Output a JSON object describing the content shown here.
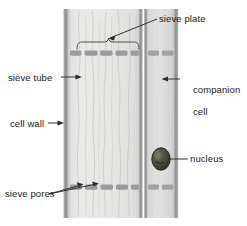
{
  "figure": {
    "type": "labelled biological diagram",
    "width": 247,
    "height": 226,
    "background": "#ffffff"
  },
  "labels": {
    "sieve_plate": "sieve plate",
    "sieve_tube": "sieve tube",
    "cell_wall": "cell wall",
    "sieve_pores": "sieve pores",
    "companion_cell_line1": "companion",
    "companion_cell_line2": "cell",
    "nucleus": "nucleus"
  },
  "colors": {
    "label_text": "#1b1b1b",
    "leader_line": "#2a2a2a",
    "cell_wall": "#9a9a9a",
    "cell_wall_dark": "#8a8a8a",
    "sieve_tube_fill": "#e6e6e4",
    "companion_cell_fill": "#dedede",
    "sieve_plate_bar": "#9b9b9b",
    "nucleus_fill": "#4a4a40",
    "nucleus_outline": "#2e2e28",
    "cytoplasm_strand": "#c9c9c7",
    "page_background": "#ffffff"
  },
  "structures": {
    "sieve_tube": {
      "description": "large central cell with faint vertical cytoplasmic strands",
      "x": 70,
      "y": 9,
      "width": 70,
      "height": 209
    },
    "companion_cell": {
      "description": "narrow cell on the right of the sieve tube, contains the nucleus",
      "x": 147,
      "y": 9,
      "width": 30,
      "height": 209
    },
    "nucleus": {
      "description": "dark oval organelle inside companion cell",
      "cx": 161,
      "cy": 159,
      "rx": 9,
      "ry": 11
    },
    "sieve_plates": [
      {
        "name": "upper-sieve-plate",
        "y": 51,
        "segments": 5,
        "companion_segments": 2
      },
      {
        "name": "lower-sieve-plate",
        "y": 185,
        "segments": 5,
        "companion_segments": 2
      }
    ],
    "cell_walls": [
      {
        "name": "left-cell-wall",
        "x": 64
      },
      {
        "name": "inner-right-cell-wall",
        "x": 140
      },
      {
        "name": "companion-left-cell-wall",
        "x": 146
      },
      {
        "name": "right-cell-wall",
        "x": 176
      }
    ],
    "bracket": {
      "name": "sieve-plate-bracket",
      "description": "curly bracket spanning the upper sieve plate",
      "x1": 77,
      "x2": 139,
      "y": 41
    }
  },
  "leader_lines": [
    {
      "name": "sieve-plate-leader",
      "from": "sieve plate label",
      "to": "upper sieve plate bracket",
      "arrow": true
    },
    {
      "name": "sieve-tube-leader",
      "from": "sieve tube label",
      "to": "sieve tube interior",
      "arrow": true
    },
    {
      "name": "cell-wall-leader",
      "from": "cell wall label",
      "to": "left cell wall",
      "arrow": true
    },
    {
      "name": "sieve-pores-leader-1",
      "from": "sieve pores label",
      "to": "lower sieve plate gap 1",
      "arrow": true
    },
    {
      "name": "sieve-pores-leader-2",
      "from": "sieve pores label",
      "to": "lower sieve plate gap 2",
      "arrow": true
    },
    {
      "name": "companion-cell-leader",
      "from": "companion cell label",
      "to": "companion cell interior",
      "arrow": true
    },
    {
      "name": "nucleus-leader",
      "from": "nucleus label",
      "to": "nucleus",
      "arrow": false
    }
  ]
}
